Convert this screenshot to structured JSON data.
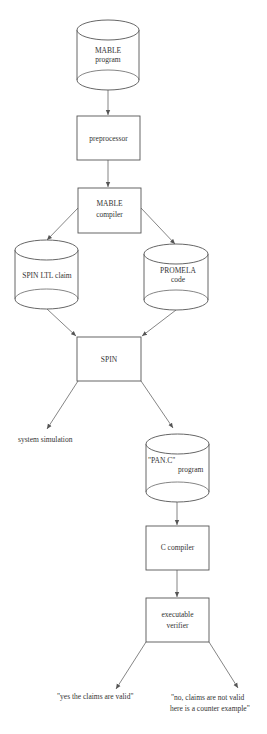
{
  "diagram": {
    "type": "flowchart",
    "nodes": [
      {
        "id": "mable_program",
        "shape": "cylinder",
        "lines": [
          "MABLE",
          "program"
        ]
      },
      {
        "id": "preprocessor",
        "shape": "box",
        "lines": [
          "preprocessor"
        ]
      },
      {
        "id": "mable_compiler",
        "shape": "box",
        "lines": [
          "MABLE",
          "compiler"
        ]
      },
      {
        "id": "spin_ltl_claim",
        "shape": "cylinder",
        "lines": [
          "SPIN LTL claim"
        ]
      },
      {
        "id": "promela_code",
        "shape": "cylinder",
        "lines": [
          "PROMELA",
          "code"
        ]
      },
      {
        "id": "spin",
        "shape": "box",
        "lines": [
          "SPIN"
        ]
      },
      {
        "id": "system_simulation",
        "shape": "text",
        "lines": [
          "system simulation"
        ]
      },
      {
        "id": "pan_c_program",
        "shape": "cylinder",
        "lines": [
          "\"PAN.C\"",
          "program"
        ]
      },
      {
        "id": "c_compiler",
        "shape": "box",
        "lines": [
          "C compiler"
        ]
      },
      {
        "id": "executable_verifier",
        "shape": "box",
        "lines": [
          "executable",
          "verifier"
        ]
      },
      {
        "id": "claims_valid",
        "shape": "text",
        "lines": [
          "\"yes the claims are valid\""
        ]
      },
      {
        "id": "claims_not_valid",
        "shape": "text",
        "lines": [
          "\"no, claims are not valid",
          "here is a counter example\""
        ]
      }
    ],
    "edges": [
      {
        "from": "mable_program",
        "to": "preprocessor"
      },
      {
        "from": "preprocessor",
        "to": "mable_compiler"
      },
      {
        "from": "mable_compiler",
        "to": "spin_ltl_claim"
      },
      {
        "from": "mable_compiler",
        "to": "promela_code"
      },
      {
        "from": "spin_ltl_claim",
        "to": "spin"
      },
      {
        "from": "promela_code",
        "to": "spin"
      },
      {
        "from": "spin",
        "to": "system_simulation"
      },
      {
        "from": "spin",
        "to": "pan_c_program"
      },
      {
        "from": "pan_c_program",
        "to": "c_compiler"
      },
      {
        "from": "c_compiler",
        "to": "executable_verifier"
      },
      {
        "from": "executable_verifier",
        "to": "claims_valid"
      },
      {
        "from": "executable_verifier",
        "to": "claims_not_valid"
      }
    ]
  },
  "labels": {
    "mable_program_1": "MABLE",
    "mable_program_2": "program",
    "preprocessor": "preprocessor",
    "mable_compiler_1": "MABLE",
    "mable_compiler_2": "compiler",
    "spin_ltl_claim": "SPIN LTL claim",
    "promela_code_1": "PROMELA",
    "promela_code_2": "code",
    "spin": "SPIN",
    "system_simulation": "system simulation",
    "pan_c_1": "\"PAN.C\"",
    "pan_c_2": "program",
    "c_compiler": "C compiler",
    "exec_verifier_1": "executable",
    "exec_verifier_2": "verifier",
    "claims_valid": "\"yes the claims are valid\"",
    "claims_not_valid_1": "\"no, claims are not valid",
    "claims_not_valid_2": "here is a counter example\""
  },
  "colors": {
    "stroke": "#555555",
    "text": "#333333",
    "background": "#ffffff"
  }
}
